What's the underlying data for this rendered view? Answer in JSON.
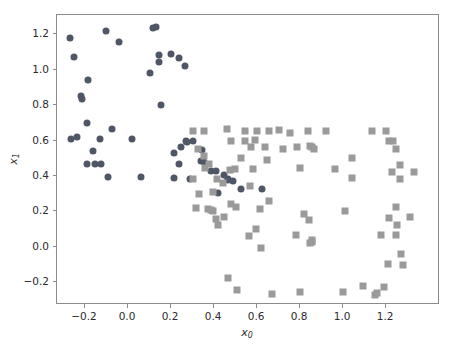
{
  "chart_data": {
    "type": "scatter",
    "title": "",
    "xlabel": "x₀",
    "ylabel": "x₁",
    "xlim": [
      -0.33,
      1.45
    ],
    "ylim": [
      -0.33,
      1.31
    ],
    "xticks": [
      -0.2,
      0.0,
      0.2,
      0.4,
      0.6,
      0.8,
      1.0,
      1.2
    ],
    "xticklabels": [
      "−0.2",
      "0.0",
      "0.2",
      "0.4",
      "0.6",
      "0.8",
      "1.0",
      "1.2"
    ],
    "yticks": [
      -0.2,
      0.0,
      0.2,
      0.4,
      0.6,
      0.8,
      1.0,
      1.2
    ],
    "yticklabels": [
      "−0.2",
      "0.0",
      "0.2",
      "0.4",
      "0.6",
      "0.8",
      "1.0",
      "1.2"
    ],
    "grid": false,
    "legend": null,
    "series": [
      {
        "name": "class-0",
        "marker": "circle",
        "color": "#4f5665",
        "size": 7,
        "points": [
          [
            -0.27,
            1.18
          ],
          [
            -0.25,
            1.07
          ],
          [
            -0.22,
            0.85
          ],
          [
            -0.215,
            0.835
          ],
          [
            -0.19,
            0.7
          ],
          [
            -0.265,
            0.61
          ],
          [
            -0.235,
            0.62
          ],
          [
            -0.185,
            0.94
          ],
          [
            -0.165,
            0.54
          ],
          [
            -0.19,
            0.47
          ],
          [
            -0.155,
            0.465
          ],
          [
            -0.125,
            0.465
          ],
          [
            -0.13,
            0.61
          ],
          [
            -0.1,
            1.22
          ],
          [
            -0.075,
            0.665
          ],
          [
            -0.095,
            0.395
          ],
          [
            -0.04,
            1.16
          ],
          [
            0.02,
            0.61
          ],
          [
            0.115,
            1.235
          ],
          [
            0.13,
            1.24
          ],
          [
            0.145,
            1.085
          ],
          [
            0.145,
            1.045
          ],
          [
            0.155,
            0.8
          ],
          [
            0.1,
            0.98
          ],
          [
            0.06,
            0.395
          ],
          [
            0.2,
            1.09
          ],
          [
            0.235,
            1.065
          ],
          [
            0.265,
            1.02
          ],
          [
            0.215,
            0.53
          ],
          [
            0.245,
            0.565
          ],
          [
            0.27,
            0.595
          ],
          [
            0.275,
            0.59
          ],
          [
            0.235,
            0.465
          ],
          [
            0.3,
            0.6
          ],
          [
            0.34,
            0.485
          ],
          [
            0.355,
            0.48
          ],
          [
            0.385,
            0.43
          ],
          [
            0.41,
            0.425
          ],
          [
            0.445,
            0.405
          ],
          [
            0.465,
            0.385
          ],
          [
            0.465,
            0.375
          ],
          [
            0.49,
            0.37
          ],
          [
            0.525,
            0.325
          ],
          [
            0.625,
            0.325
          ],
          [
            0.345,
            0.545
          ],
          [
            0.29,
            0.385
          ],
          [
            0.42,
            0.305
          ],
          [
            0.215,
            0.39
          ]
        ]
      },
      {
        "name": "class-1",
        "marker": "square",
        "color": "#9a9a9a",
        "size": 7,
        "points": [
          [
            0.3,
            0.655
          ],
          [
            0.325,
            0.555
          ],
          [
            0.355,
            0.515
          ],
          [
            0.36,
            0.445
          ],
          [
            0.3,
            0.385
          ],
          [
            0.33,
            0.3
          ],
          [
            0.315,
            0.22
          ],
          [
            0.37,
            0.215
          ],
          [
            0.385,
            0.21
          ],
          [
            0.395,
            0.2
          ],
          [
            0.41,
            0.155
          ],
          [
            0.395,
            0.31
          ],
          [
            0.415,
            0.385
          ],
          [
            0.46,
            0.665
          ],
          [
            0.48,
            0.6
          ],
          [
            0.475,
            0.435
          ],
          [
            0.495,
            0.44
          ],
          [
            0.5,
            0.225
          ],
          [
            0.525,
            0.5
          ],
          [
            0.545,
            0.6
          ],
          [
            0.545,
            0.655
          ],
          [
            0.57,
            0.565
          ],
          [
            0.58,
            0.44
          ],
          [
            0.59,
            0.605
          ],
          [
            0.6,
            0.655
          ],
          [
            0.635,
            0.565
          ],
          [
            0.645,
            0.49
          ],
          [
            0.655,
            0.655
          ],
          [
            0.7,
            0.66
          ],
          [
            0.72,
            0.555
          ],
          [
            0.755,
            0.64
          ],
          [
            0.785,
            0.565
          ],
          [
            0.8,
            0.445
          ],
          [
            0.835,
            0.655
          ],
          [
            0.845,
            0.57
          ],
          [
            0.855,
            0.565
          ],
          [
            0.865,
            0.555
          ],
          [
            0.92,
            0.655
          ],
          [
            0.96,
            0.44
          ],
          [
            1.04,
            0.5
          ],
          [
            1.04,
            0.39
          ],
          [
            1.135,
            0.655
          ],
          [
            1.2,
            0.655
          ],
          [
            1.215,
            0.6
          ],
          [
            1.23,
            0.595
          ],
          [
            1.245,
            0.555
          ],
          [
            1.265,
            0.46
          ],
          [
            1.265,
            0.385
          ],
          [
            1.245,
            0.225
          ],
          [
            1.25,
            0.125
          ],
          [
            1.27,
            -0.04
          ],
          [
            1.21,
            -0.1
          ],
          [
            1.28,
            -0.105
          ],
          [
            1.31,
            0.165
          ],
          [
            1.33,
            0.42
          ],
          [
            1.225,
            0.42
          ],
          [
            0.42,
            0.125
          ],
          [
            0.445,
            0.165
          ],
          [
            0.465,
            -0.175
          ],
          [
            0.505,
            -0.245
          ],
          [
            0.56,
            0.06
          ],
          [
            0.595,
            0.1
          ],
          [
            0.62,
            -0.01
          ],
          [
            0.67,
            -0.265
          ],
          [
            0.78,
            0.065
          ],
          [
            0.8,
            -0.255
          ],
          [
            0.84,
            0.15
          ],
          [
            0.845,
            0.02
          ],
          [
            0.855,
            0.025
          ],
          [
            0.855,
            0.04
          ],
          [
            1.0,
            -0.255
          ],
          [
            1.09,
            -0.225
          ],
          [
            1.15,
            -0.275
          ],
          [
            1.19,
            -0.23
          ],
          [
            1.155,
            -0.26
          ],
          [
            1.175,
            0.065
          ],
          [
            1.215,
            0.16
          ],
          [
            1.245,
            0.065
          ],
          [
            1.01,
            0.2
          ],
          [
            0.82,
            0.185
          ],
          [
            0.615,
            0.215
          ],
          [
            0.565,
            0.345
          ],
          [
            0.655,
            0.26
          ],
          [
            0.48,
            0.24
          ],
          [
            0.44,
            0.36
          ],
          [
            0.375,
            0.47
          ],
          [
            0.355,
            0.655
          ]
        ]
      }
    ]
  },
  "axes": {
    "frame_color": "#8b8b8b",
    "tick_color": "#8b8b8b",
    "text_color": "#2b2b2b",
    "background": "#ffffff"
  }
}
